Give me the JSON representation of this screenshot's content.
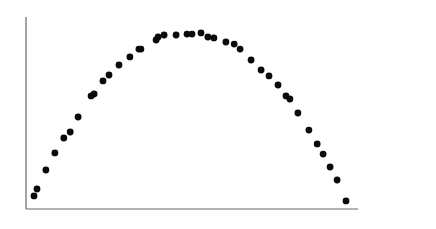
{
  "chart_data": {
    "type": "scatter",
    "title": "",
    "xlabel": "",
    "ylabel": "",
    "grid": false,
    "legend": null,
    "xlim": [
      0,
      100
    ],
    "ylim": [
      0,
      100
    ],
    "note": "Unlabeled axes; values are normalized 0-100 positions estimated from pixels (x from left axis, y from bottom axis).",
    "points": [
      {
        "x": 2.4,
        "y": 6.8
      },
      {
        "x": 3.3,
        "y": 10.4
      },
      {
        "x": 6.0,
        "y": 20.3
      },
      {
        "x": 8.7,
        "y": 29.2
      },
      {
        "x": 11.4,
        "y": 37.0
      },
      {
        "x": 13.3,
        "y": 40.1
      },
      {
        "x": 15.7,
        "y": 47.9
      },
      {
        "x": 19.6,
        "y": 58.9
      },
      {
        "x": 20.5,
        "y": 59.9
      },
      {
        "x": 23.2,
        "y": 66.7
      },
      {
        "x": 25.0,
        "y": 69.8
      },
      {
        "x": 28.0,
        "y": 75.0
      },
      {
        "x": 31.3,
        "y": 79.2
      },
      {
        "x": 34.0,
        "y": 83.3
      },
      {
        "x": 34.6,
        "y": 83.3
      },
      {
        "x": 39.2,
        "y": 88.0
      },
      {
        "x": 39.8,
        "y": 89.6
      },
      {
        "x": 41.6,
        "y": 90.6
      },
      {
        "x": 45.2,
        "y": 90.6
      },
      {
        "x": 48.5,
        "y": 91.1
      },
      {
        "x": 50.0,
        "y": 91.1
      },
      {
        "x": 52.7,
        "y": 91.7
      },
      {
        "x": 54.8,
        "y": 89.6
      },
      {
        "x": 56.6,
        "y": 89.1
      },
      {
        "x": 60.2,
        "y": 87.0
      },
      {
        "x": 62.7,
        "y": 85.9
      },
      {
        "x": 64.5,
        "y": 83.3
      },
      {
        "x": 67.8,
        "y": 77.6
      },
      {
        "x": 70.8,
        "y": 72.4
      },
      {
        "x": 73.2,
        "y": 69.3
      },
      {
        "x": 75.9,
        "y": 64.6
      },
      {
        "x": 78.3,
        "y": 58.9
      },
      {
        "x": 79.5,
        "y": 57.3
      },
      {
        "x": 81.9,
        "y": 50.0
      },
      {
        "x": 85.2,
        "y": 41.1
      },
      {
        "x": 87.7,
        "y": 33.9
      },
      {
        "x": 89.5,
        "y": 28.6
      },
      {
        "x": 91.6,
        "y": 21.9
      },
      {
        "x": 93.7,
        "y": 15.1
      },
      {
        "x": 96.4,
        "y": 4.2
      }
    ],
    "shape": "inverted parabola (rises, peaks near x≈50, then falls)"
  },
  "plot": {
    "origin_px": [
      26,
      209
    ],
    "x_end_px": 358,
    "y_top_px": 17,
    "point_color": "#0a0a0a",
    "axis_color": "#666666",
    "point_radius": 3.4
  }
}
